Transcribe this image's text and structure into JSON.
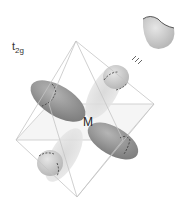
{
  "title": {
    "main": "t",
    "subscript": "2g"
  },
  "center_label": "M",
  "colors": {
    "edge": "#c8c8c8",
    "lobe_dark": "#8a8a8a",
    "lobe_light": "#c4c4c4",
    "text": "#333333"
  },
  "octahedron_vertices": {
    "top": [
      76,
      41
    ],
    "bottom": [
      77,
      197
    ],
    "left": [
      16,
      140
    ],
    "right": [
      154,
      104
    ],
    "back": [
      49,
      104
    ],
    "front": [
      123,
      140
    ]
  },
  "legend": {
    "lobe_icon": "half-lobe",
    "relation": "≡"
  }
}
